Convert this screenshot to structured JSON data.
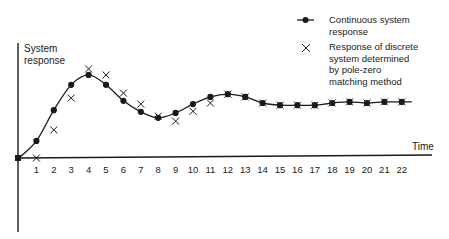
{
  "chart_data": {
    "type": "line",
    "title": "",
    "xlabel": "Time",
    "ylabel": "System response",
    "x": [
      0,
      1,
      2,
      3,
      4,
      5,
      6,
      7,
      8,
      9,
      10,
      11,
      12,
      13,
      14,
      15,
      16,
      17,
      18,
      19,
      20,
      21,
      22
    ],
    "series": [
      {
        "name": "Continuous system response",
        "marker": "dot",
        "values": [
          0,
          0.31,
          0.87,
          1.33,
          1.51,
          1.33,
          1.04,
          0.84,
          0.73,
          0.82,
          0.98,
          1.11,
          1.16,
          1.11,
          1.0,
          0.96,
          0.96,
          0.96,
          1.0,
          1.02,
          1.0,
          1.02,
          1.02
        ]
      },
      {
        "name": "Response of discrete system determined by pole-zero matching method",
        "marker": "cross",
        "values": [
          0,
          0,
          0.51,
          1.09,
          1.62,
          1.51,
          1.18,
          0.98,
          0.76,
          0.67,
          0.85,
          1.0,
          1.16,
          1.11,
          1.0,
          0.96,
          0.96,
          0.96,
          1.0,
          1.02,
          1.0,
          1.02,
          1.02
        ]
      }
    ],
    "x_tick_labels": [
      "1",
      "2",
      "3",
      "4",
      "5",
      "6",
      "7",
      "8",
      "9",
      "10",
      "11",
      "12",
      "13",
      "14",
      "15",
      "16",
      "17",
      "18",
      "19",
      "20",
      "21",
      "22"
    ],
    "grid": false,
    "legend_position": "top-right",
    "legend": [
      {
        "label_lines": [
          "Continuous system",
          "response"
        ],
        "marker": "dot-line"
      },
      {
        "label_lines": [
          "Response of discrete",
          "system determined",
          "by pole-zero",
          "matching method"
        ],
        "marker": "cross"
      }
    ]
  },
  "layout": {
    "origin_px": [
      19,
      158
    ],
    "x_step_px": 17.4,
    "y_unit_px": 55,
    "x_axis_end_px": 432,
    "y_axis_top_px": 43,
    "y_axis_bottom_px": 232
  },
  "colors": {
    "ink": "#1a1a1a",
    "background": "#ffffff"
  }
}
